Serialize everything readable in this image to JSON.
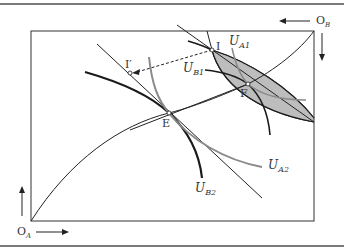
{
  "diagram": {
    "type": "edgeworth-box",
    "origins": {
      "a": {
        "label": "O",
        "sub": "A"
      },
      "b": {
        "label": "O",
        "sub": "B"
      }
    },
    "points": {
      "I": "I",
      "I_prime": "I′",
      "E": "E",
      "F": "F"
    },
    "curves": {
      "ua1": {
        "label": "U",
        "sub": "A1"
      },
      "ub1": {
        "label": "U",
        "sub": "B1"
      },
      "ua2": {
        "label": "U",
        "sub": "A2"
      },
      "ub2": {
        "label": "U",
        "sub": "B2"
      }
    },
    "colors": {
      "lens_fill": "#bdbdbd",
      "ua_curve": "#8a8a8a",
      "ub_curve": "#1a1a1a",
      "line": "#222222",
      "rule": "#7a7a7a"
    }
  }
}
